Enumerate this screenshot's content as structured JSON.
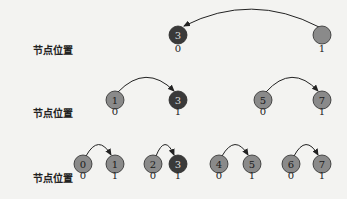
{
  "colors": {
    "node_fill": "#8a8a8a",
    "node_highlight": "#3a3a3a",
    "node_stroke": "#2a2a2a",
    "node_text": "#1a1a1a",
    "node_text_highlight": "#dddddd",
    "arrow": "#222222"
  },
  "rows": [
    {
      "label": "节点位置",
      "label_y": 48,
      "node_y": 35,
      "pos_y": 49,
      "nodes": [
        {
          "x": 178,
          "text": "3",
          "pos": "0",
          "highlight": true
        },
        {
          "x": 322,
          "text": "",
          "pos": "1",
          "highlight": false
        }
      ],
      "arrows": [
        {
          "from": 322,
          "to": 178,
          "dir": "left",
          "height": 22
        }
      ]
    },
    {
      "label": "节点位置",
      "label_y": 111,
      "node_y": 100,
      "pos_y": 112,
      "nodes": [
        {
          "x": 115,
          "text": "1",
          "pos": "0",
          "highlight": false
        },
        {
          "x": 178,
          "text": "3",
          "pos": "1",
          "highlight": true
        },
        {
          "x": 263,
          "text": "5",
          "pos": "0",
          "highlight": false
        },
        {
          "x": 322,
          "text": "7",
          "pos": "1",
          "highlight": false
        }
      ],
      "arrows": [
        {
          "from": 115,
          "to": 178,
          "dir": "right",
          "height": 18
        },
        {
          "from": 263,
          "to": 322,
          "dir": "right",
          "height": 18
        }
      ]
    },
    {
      "label": "节点位置",
      "label_y": 176,
      "node_y": 164,
      "pos_y": 176,
      "nodes": [
        {
          "x": 83,
          "text": "0",
          "pos": "0",
          "highlight": false
        },
        {
          "x": 115,
          "text": "1",
          "pos": "1",
          "highlight": false
        },
        {
          "x": 153,
          "text": "2",
          "pos": "0",
          "highlight": false
        },
        {
          "x": 178,
          "text": "3",
          "pos": "1",
          "highlight": true
        },
        {
          "x": 219,
          "text": "4",
          "pos": "0",
          "highlight": false
        },
        {
          "x": 252,
          "text": "5",
          "pos": "1",
          "highlight": false
        },
        {
          "x": 291,
          "text": "6",
          "pos": "0",
          "highlight": false
        },
        {
          "x": 322,
          "text": "7",
          "pos": "1",
          "highlight": false
        }
      ],
      "arrows": [
        {
          "from": 83,
          "to": 115,
          "dir": "right",
          "height": 14
        },
        {
          "from": 153,
          "to": 178,
          "dir": "right",
          "height": 14
        },
        {
          "from": 219,
          "to": 252,
          "dir": "right",
          "height": 14
        },
        {
          "from": 291,
          "to": 322,
          "dir": "right",
          "height": 14
        }
      ]
    }
  ]
}
